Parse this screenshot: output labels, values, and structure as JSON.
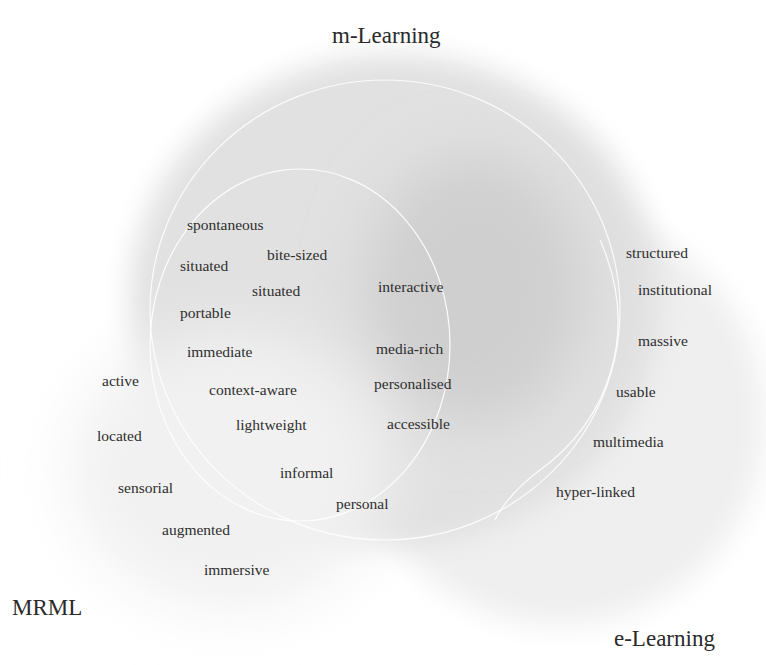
{
  "diagram": {
    "type": "venn",
    "sets": [
      {
        "id": "m-learning",
        "label": "m-Learning"
      },
      {
        "id": "e-learning",
        "label": "e-Learning"
      },
      {
        "id": "mrml",
        "label": "MRML"
      }
    ],
    "regions": {
      "mrml_and_m_learning": {
        "terms": [
          "spontaneous",
          "bite-sized",
          "situated",
          "situated",
          "portable",
          "immediate",
          "context-aware",
          "lightweight",
          "informal",
          "personal"
        ]
      },
      "all_three": {
        "terms": [
          "interactive",
          "media-rich",
          "personalised",
          "accessible"
        ]
      },
      "e_learning_only": {
        "terms": [
          "structured",
          "institutional",
          "massive",
          "usable",
          "multimedia",
          "hyper-linked"
        ]
      },
      "mrml_only": {
        "terms": [
          "active",
          "located",
          "sensorial",
          "augmented",
          "immersive"
        ]
      }
    }
  }
}
